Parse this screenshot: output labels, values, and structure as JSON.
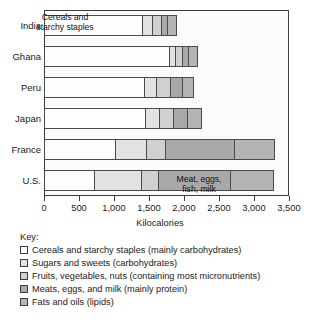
{
  "chart_data": {
    "type": "bar",
    "orientation": "horizontal",
    "stacked": true,
    "title": "",
    "xlabel": "Kilocalories",
    "ylabel": "",
    "xlim": [
      0,
      3500
    ],
    "grid": false,
    "legend_position": "below",
    "xticks": [
      0,
      500,
      1000,
      1500,
      2000,
      2500,
      3000,
      3500
    ],
    "xtick_labels": [
      "0",
      "500",
      "1,000",
      "1,500",
      "2,000",
      "2,500",
      "3,000",
      "3,500"
    ],
    "categories": [
      "India",
      "Ghana",
      "Peru",
      "Japan",
      "France",
      "U.S."
    ],
    "series": [
      {
        "name": "Cereals and starchy staples (mainly carbohydrates)",
        "short_name": "Cereals and starchy staples",
        "color": "#fdfdfd",
        "values": [
          1400,
          1780,
          1430,
          1440,
          1010,
          720
        ]
      },
      {
        "name": "Sugars and sweets (carbohydrates)",
        "short_name": "Sugars and sweets",
        "color": "#e2e2e2",
        "values": [
          140,
          90,
          175,
          200,
          450,
          660
        ]
      },
      {
        "name": "Fruits, vegetables, nuts (containing most micronutrients)",
        "short_name": "Fruits, vegetables, nuts",
        "color": "#d0d0d0",
        "values": [
          130,
          100,
          190,
          200,
          275,
          245
        ]
      },
      {
        "name": "Meats, eggs, and milk (mainly protein)",
        "short_name": "Meats, eggs, and milk",
        "color": "#a8a8a8",
        "values": [
          85,
          90,
          170,
          200,
          980,
          1035
        ]
      },
      {
        "name": "Fats and oils (lipids)",
        "short_name": "Fats and oils",
        "color": "#b4b4b4",
        "values": [
          130,
          120,
          160,
          200,
          575,
          605
        ]
      }
    ],
    "totals": [
      1885,
      2180,
      2125,
      2240,
      3290,
      3265
    ],
    "annotations": [
      {
        "id": "india-note",
        "text": "Cereals and\nstarchy staples",
        "bar": "India",
        "segment": "Cereals and starchy staples"
      },
      {
        "id": "us-note",
        "text": "Meat, eggs,\nfish, milk",
        "bar": "U.S.",
        "segment": "Meats, eggs, and milk"
      }
    ]
  },
  "legend": {
    "title": "Key:",
    "items": [
      {
        "label": "Cereals and starchy staples (mainly carbohydrates)",
        "color": "#fdfdfd"
      },
      {
        "label": "Sugars and sweets (carbohydrates)",
        "color": "#e2e2e2"
      },
      {
        "label": "Fruits, vegetables, nuts (containing most micronutrients)",
        "color": "#d0d0d0"
      },
      {
        "label": "Meats, eggs, and milk (mainly protein)",
        "color": "#a8a8a8"
      },
      {
        "label": "Fats and oils (lipids)",
        "color": "#b4b4b4"
      }
    ]
  }
}
